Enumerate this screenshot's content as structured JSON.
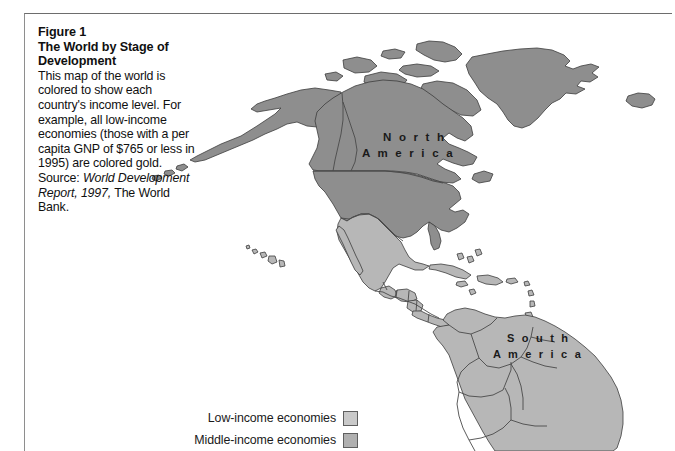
{
  "figure": {
    "number_label": "Figure 1",
    "title_line1": "The World by Stage of",
    "title_line2": "Development",
    "body_before_italic": "This map of the world is colored to show each country's income level. For example, all low-income economies (those with a per capita GNP of $765 or less in 1995) are colored gold. Source: ",
    "body_italic": "World Development Report, 1997,",
    "body_after_italic": " The World Bank."
  },
  "map": {
    "labels": [
      {
        "id": "north-america",
        "text_line1": "N o r t h",
        "text_line2": "A m e r i c a"
      },
      {
        "id": "south-america",
        "text_line1": "S o u t h",
        "text_line2": "A m e r i c a"
      }
    ],
    "colors": {
      "ocean": "#ffffff",
      "low_income": "#c3c3c3",
      "middle_income": "#b7b7b7",
      "high_income": "#8e8e8e",
      "border_stroke": "#4a4a4a",
      "coast_stroke": "#3c3c3c",
      "label_text": "#1a1a1a"
    }
  },
  "legend": {
    "items": [
      {
        "label": "Low-income economies",
        "swatch_color": "#c9c9c9"
      },
      {
        "label": "Middle-income economies",
        "swatch_color": "#b0b0b0"
      }
    ]
  }
}
